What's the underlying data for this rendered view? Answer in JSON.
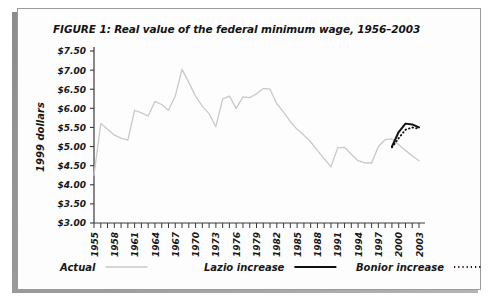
{
  "figure": {
    "title": "FIGURE 1: Real value of the federal minimum wage, 1956–2003"
  },
  "chart_data": {
    "type": "line",
    "title": "FIGURE 1: Real value of the federal minimum wage, 1956–2003",
    "xlabel": "",
    "ylabel": "1999 dollars",
    "xlim": [
      1955,
      2003
    ],
    "ylim": [
      3.0,
      7.5
    ],
    "grid": false,
    "legend_position": "bottom",
    "ytick_labels": [
      "$3.00",
      "$3.50",
      "$4.00",
      "$4.50",
      "$5.00",
      "$5.50",
      "$6.00",
      "$6.50",
      "$7.00",
      "$7.50"
    ],
    "ytick_values": [
      3.0,
      3.5,
      4.0,
      4.5,
      5.0,
      5.5,
      6.0,
      6.5,
      7.0,
      7.5
    ],
    "xtick_labels": [
      "1955",
      "1958",
      "1961",
      "1964",
      "1967",
      "1970",
      "1973",
      "1976",
      "1979",
      "1982",
      "1985",
      "1988",
      "1991",
      "1994",
      "1997",
      "2000",
      "2003"
    ],
    "xtick_values": [
      1955,
      1958,
      1961,
      1964,
      1967,
      1970,
      1973,
      1976,
      1979,
      1982,
      1985,
      1988,
      1991,
      1994,
      1997,
      2000,
      2003
    ],
    "xtick_minor_step": 1,
    "series": [
      {
        "name": "Actual",
        "style": "solid",
        "color": "#c9c9c9",
        "x": [
          1955,
          1956,
          1957,
          1958,
          1959,
          1960,
          1961,
          1962,
          1963,
          1964,
          1965,
          1966,
          1967,
          1968,
          1969,
          1970,
          1971,
          1972,
          1973,
          1974,
          1975,
          1976,
          1977,
          1978,
          1979,
          1980,
          1981,
          1982,
          1983,
          1984,
          1985,
          1986,
          1987,
          1988,
          1989,
          1990,
          1991,
          1992,
          1993,
          1994,
          1995,
          1996,
          1997,
          1998,
          1999,
          2000,
          2001,
          2002,
          2003
        ],
        "y": [
          4.25,
          5.6,
          5.45,
          5.3,
          5.22,
          5.17,
          5.95,
          5.88,
          5.8,
          6.18,
          6.1,
          5.95,
          6.32,
          7.02,
          6.68,
          6.32,
          6.05,
          5.86,
          5.52,
          6.25,
          6.32,
          6.0,
          6.3,
          6.28,
          6.38,
          6.52,
          6.5,
          6.12,
          5.9,
          5.65,
          5.45,
          5.3,
          5.12,
          4.9,
          4.68,
          4.47,
          4.97,
          4.98,
          4.8,
          4.63,
          4.57,
          4.57,
          5.0,
          5.18,
          5.2,
          5.05,
          4.9,
          4.76,
          4.63
        ]
      },
      {
        "name": "Lazio increase",
        "style": "solid",
        "color": "#111111",
        "x": [
          1999,
          2000,
          2001,
          2002,
          2003
        ],
        "y": [
          5.0,
          5.38,
          5.6,
          5.58,
          5.5
        ]
      },
      {
        "name": "Bonior increase",
        "style": "dotted",
        "color": "#111111",
        "x": [
          1999,
          2000,
          2001,
          2002,
          2003
        ],
        "y": [
          4.98,
          5.22,
          5.44,
          5.5,
          5.47
        ]
      }
    ]
  },
  "legend": {
    "items": [
      {
        "label": "Actual",
        "style": "solid",
        "color": "#c9c9c9"
      },
      {
        "label": "Lazio increase",
        "style": "solid",
        "color": "#111111"
      },
      {
        "label": "Bonior increase",
        "style": "dotted",
        "color": "#111111"
      }
    ]
  }
}
